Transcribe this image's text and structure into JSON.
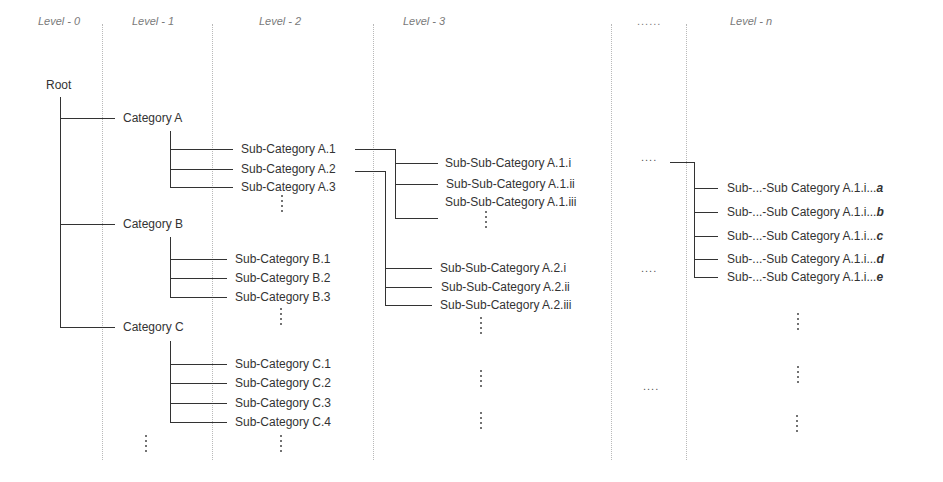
{
  "levels": [
    {
      "label": "Level - 0"
    },
    {
      "label": "Level - 1"
    },
    {
      "label": "Level - 2"
    },
    {
      "label": "Level - 3"
    },
    {
      "label": "......"
    },
    {
      "label": "Level - n"
    }
  ],
  "root": {
    "label": "Root"
  },
  "categories": [
    {
      "label": "Category A",
      "subcategories": [
        "Sub-Category A.1",
        "Sub-Category A.2",
        "Sub-Category A.3"
      ]
    },
    {
      "label": "Category B",
      "subcategories": [
        "Sub-Category B.1",
        "Sub-Category B.2",
        "Sub-Category B.3"
      ]
    },
    {
      "label": "Category C",
      "subcategories": [
        "Sub-Category C.1",
        "Sub-Category C.2",
        "Sub-Category C.3",
        "Sub-Category C.4"
      ]
    }
  ],
  "level3": {
    "a1": [
      "Sub-Sub-Category A.1.i",
      "Sub-Sub-Category A.1.ii",
      "Sub-Sub-Category A.1.iii"
    ],
    "a2": [
      "Sub-Sub-Category A.2.i",
      "Sub-Sub-Category A.2.ii",
      "Sub-Sub-Category A.2.iii"
    ]
  },
  "levelN": {
    "prefix": "Sub-...-Sub Category A.1.i...",
    "suffixes": [
      "a",
      "b",
      "c",
      "d",
      "e"
    ]
  },
  "ellipsis": {
    "horizontal": "....",
    "vertical": "⋮"
  }
}
